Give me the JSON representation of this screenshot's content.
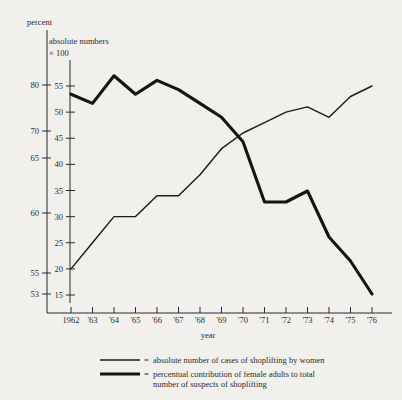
{
  "chart_data": {
    "type": "line",
    "title": "",
    "xlabel": "year",
    "categories": [
      "1962",
      "'63",
      "'64",
      "'65",
      "'66",
      "'67",
      "'68",
      "'69",
      "'70",
      "'71",
      "'72",
      "'73",
      "'74",
      "'75",
      "'76"
    ],
    "x_tick_labels": [
      "1962",
      "'63",
      "'64",
      "'65",
      "'66",
      "'67",
      "'68",
      "'69",
      "'70",
      "'71",
      "'72",
      "'73",
      "'74",
      "'75",
      "'76"
    ],
    "grid": false,
    "legend_position": "bottom",
    "axes": {
      "left_percent": {
        "label": "percent",
        "tick_labels": [
          "80",
          "70",
          "65",
          "60",
          "55",
          "53"
        ],
        "tick_values": [
          80,
          70,
          65,
          60,
          55,
          53
        ],
        "note": "non-linear tick spacing as drawn"
      },
      "left_absolute": {
        "label": "absolute numbers",
        "label2": "× 100",
        "tick_labels": [
          "55",
          "50",
          "45",
          "40",
          "35",
          "30",
          "25",
          "20",
          "15"
        ],
        "tick_values": [
          55,
          50,
          45,
          40,
          35,
          30,
          25,
          20,
          15
        ],
        "ylim": [
          15,
          55
        ]
      }
    },
    "series": [
      {
        "name": "absolute number of cases of shoplifting by women",
        "style": "thin",
        "axis": "left_absolute",
        "units": "hundreds of cases",
        "values": [
          20,
          25,
          30,
          30,
          34,
          34,
          38,
          43,
          46,
          48,
          50,
          51,
          49,
          53,
          55
        ]
      },
      {
        "name": "percentual contribution of female adults to total number of suspects of shoplifting",
        "style": "thick",
        "axis": "left_percent",
        "units": "percent",
        "values": [
          78,
          76,
          82,
          78,
          81,
          79,
          76,
          73,
          68,
          61,
          61,
          62,
          58,
          56,
          53
        ]
      }
    ],
    "legend": [
      {
        "marker": "thin-line",
        "equals": "=",
        "lines": [
          "absolute number of cases of shoplifting by women"
        ]
      },
      {
        "marker": "thick-line",
        "equals": "=",
        "lines": [
          "percentual contribution of female adults to total",
          "number of suspects of shoplifting"
        ]
      }
    ],
    "colors": {
      "ink": "#1a1a1a",
      "background": "#f2f0ec"
    }
  }
}
